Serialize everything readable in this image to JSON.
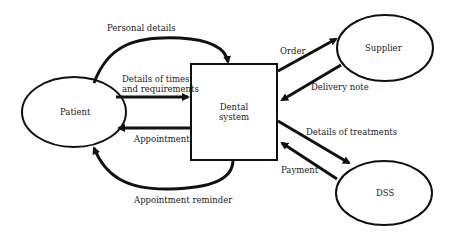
{
  "diagram": {
    "type": "context-diagram",
    "entities": [
      {
        "id": "patient",
        "label": "Patient",
        "shape": "ellipse"
      },
      {
        "id": "supplier",
        "label": "Supplier",
        "shape": "ellipse"
      },
      {
        "id": "dss",
        "label": "DSS",
        "shape": "ellipse"
      }
    ],
    "system": {
      "id": "dental-system",
      "label_line1": "Dental",
      "label_line2": "system",
      "shape": "rectangle"
    },
    "flows": [
      {
        "id": "personal-details",
        "label": "Personal details",
        "from": "patient",
        "to": "dental-system"
      },
      {
        "id": "details-times",
        "label_line1": "Details of times",
        "label_line2": "and requirements",
        "from": "patient",
        "to": "dental-system"
      },
      {
        "id": "appointment",
        "label": "Appointment",
        "from": "dental-system",
        "to": "patient"
      },
      {
        "id": "appointment-reminder",
        "label": "Appointment reminder",
        "from": "dental-system",
        "to": "patient"
      },
      {
        "id": "order",
        "label": "Order",
        "from": "dental-system",
        "to": "supplier"
      },
      {
        "id": "delivery-note",
        "label": "Delivery note",
        "from": "supplier",
        "to": "dental-system"
      },
      {
        "id": "details-treatments",
        "label": "Details of treatments",
        "from": "dental-system",
        "to": "dss"
      },
      {
        "id": "payment",
        "label": "Payment",
        "from": "dss",
        "to": "dental-system"
      }
    ]
  }
}
